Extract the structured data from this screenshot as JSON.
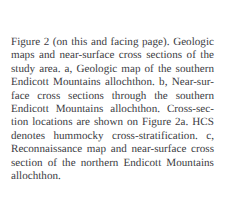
{
  "document": {
    "type": "figure-caption",
    "background_color": "#ffffff",
    "text_color": "#3b3b42",
    "full_text": "Figure 2 (on this and facing page). Geologic maps and near-surface cross sections of the study area. a, Geologic map of the southern Endicott Mountains allochthon. b, Near-surface cross sections through the southern Endicott Mountains allochthon. Cross-section locations are shown on Figure 2a. HCS denotes hummocky cross-stratification. c, Reconnaissance map and near-surface cross section of the northern Endicott Mountains allochthon.",
    "lines": [
      {
        "align": "justify",
        "words": [
          "Figure",
          "2",
          "(on",
          "this",
          "and",
          "facing",
          "page).",
          "Geologic"
        ]
      },
      {
        "align": "justify",
        "words": [
          "maps",
          "and",
          "near-surface",
          "cross",
          "sections",
          "of",
          "the"
        ]
      },
      {
        "align": "justify",
        "words": [
          "study",
          "area.",
          "a,",
          "Geologic",
          "map",
          "of",
          "the",
          "southern"
        ]
      },
      {
        "align": "justify",
        "words": [
          "Endicott",
          "Mountains",
          "allochthon.",
          "b,",
          "Near-sur-"
        ]
      },
      {
        "align": "justify",
        "words": [
          "face",
          "cross",
          "sections",
          "through",
          "the",
          "southern"
        ]
      },
      {
        "align": "justify",
        "words": [
          "Endicott",
          "Mountains",
          "allochthon.",
          "Cross-sec-"
        ]
      },
      {
        "align": "justify",
        "words": [
          "tion",
          "locations",
          "are",
          "shown",
          "on",
          "Figure",
          "2a.",
          "HCS"
        ]
      },
      {
        "align": "justify",
        "words": [
          "denotes",
          "hummocky",
          "cross-stratification.",
          "c,"
        ]
      },
      {
        "align": "justify",
        "words": [
          "Reconnaissance",
          "map",
          "and",
          "near-surface",
          "cross"
        ]
      },
      {
        "align": "justify",
        "words": [
          "section",
          "of",
          "the",
          "northern",
          "Endicott",
          "Mountains"
        ]
      },
      {
        "align": "left",
        "words": [
          "allochthon."
        ]
      }
    ]
  }
}
